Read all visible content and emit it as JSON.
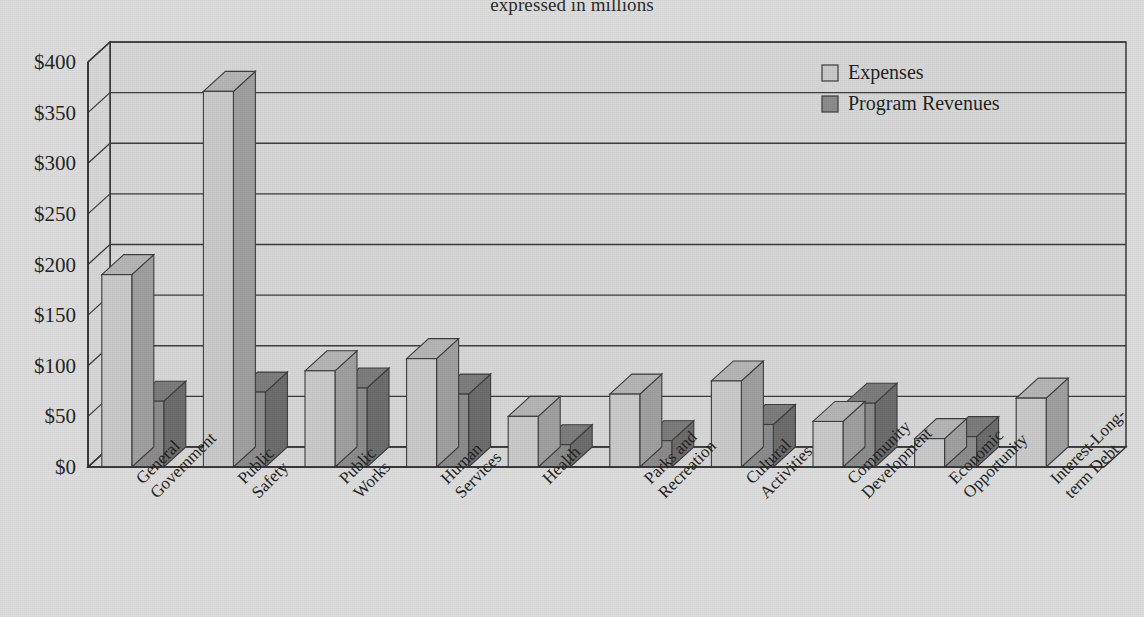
{
  "title": "expressed in millions",
  "legend": {
    "position": "top-right",
    "items": [
      {
        "label": "Expenses",
        "swatch": "light-gray-square-icon",
        "color": "#c9c9c9"
      },
      {
        "label": "Program Revenues",
        "swatch": "dark-gray-square-icon",
        "color": "#8a8a8a"
      }
    ]
  },
  "axis": {
    "y_ticks": [
      "$0",
      "$50",
      "$100",
      "$150",
      "$200",
      "$250",
      "$300",
      "$350",
      "$400"
    ],
    "y_min": 0,
    "y_max": 400,
    "y_step": 50
  },
  "chart_data": {
    "type": "bar",
    "title": "expressed in millions",
    "xlabel": "",
    "ylabel": "",
    "ylim": [
      0,
      400
    ],
    "ytick_step": 50,
    "grid": true,
    "legend_position": "top-right",
    "style": "3d-clustered-column",
    "categories": [
      "General Government",
      "Public Safety",
      "Public Works",
      "Human Services",
      "Health",
      "Parks and Recreation",
      "Cultural Activities",
      "Community Development",
      "Economic Opportunity",
      "Interest-Long-term Debt"
    ],
    "series": [
      {
        "name": "Expenses",
        "color": "#c9c9c9",
        "values": [
          190,
          371,
          95,
          107,
          50,
          72,
          85,
          45,
          28,
          68
        ]
      },
      {
        "name": "Program Revenues",
        "color": "#8a8a8a",
        "values": [
          65,
          74,
          78,
          72,
          22,
          26,
          42,
          63,
          30,
          0
        ]
      }
    ]
  },
  "colors": {
    "background": "#dcdcdc",
    "plot_area": "#d6d6d6",
    "axis_line": "#2b2b2b",
    "gridline": "#3a3a3a",
    "expenses_face": "#c9c9c9",
    "expenses_side": "#9e9e9e",
    "expenses_top": "#b4b4b4",
    "revenues_face": "#8a8a8a",
    "revenues_side": "#6b6b6b",
    "revenues_top": "#7b7b7b"
  }
}
